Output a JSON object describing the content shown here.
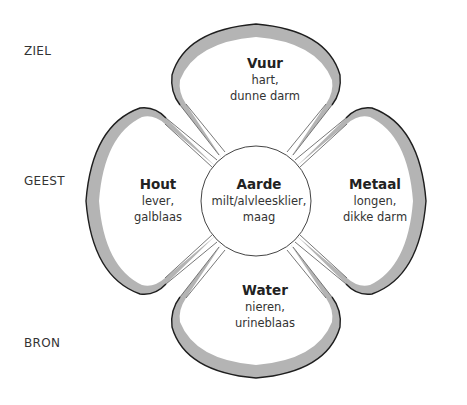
{
  "levels": [
    {
      "label": "ZIEL"
    },
    {
      "label": "GEEST"
    },
    {
      "label": "BRON"
    }
  ],
  "center": {
    "element": "Aarde",
    "organs_line1": "milt/alvleesklier,",
    "organs_line2": "maag"
  },
  "petals": {
    "top": {
      "element": "Vuur",
      "organs_line1": "hart,",
      "organs_line2": "dunne darm"
    },
    "left": {
      "element": "Hout",
      "organs_line1": "lever,",
      "organs_line2": "galblaas"
    },
    "right": {
      "element": "Metaal",
      "organs_line1": "longen,",
      "organs_line2": "dikke darm"
    },
    "bottom": {
      "element": "Water",
      "organs_line1": "nieren,",
      "organs_line2": "urineblaas"
    }
  },
  "colors": {
    "band": "#b4b4b4",
    "outline": "#1e1e1e",
    "thin_line": "#555555"
  }
}
